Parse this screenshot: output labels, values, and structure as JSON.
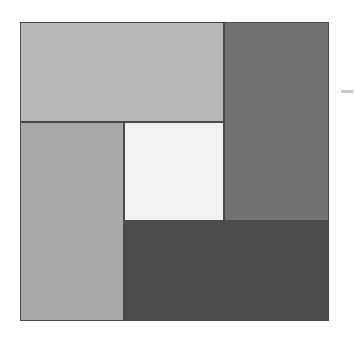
{
  "figure": {
    "background_color": "#ffffff",
    "width": 355,
    "height": 346,
    "border_color": "#4a4a4a"
  },
  "plot_area": {
    "x": 20,
    "y": 22,
    "width": 309,
    "height": 299
  },
  "axis_tick": {
    "name": "right-axis-tick",
    "x": 341,
    "y": 90,
    "width": 12,
    "height": 3,
    "color": "#c9c9c9"
  },
  "chart_data": {
    "type": "treemap",
    "title": "",
    "subtitle": "",
    "xlabel": "",
    "ylabel": "",
    "grid": false,
    "legend": "none",
    "layout": "pinwheel",
    "colormap": "greys",
    "total_area": 92391,
    "categories": [
      "A",
      "B",
      "C",
      "D",
      "E"
    ],
    "values": [
      20400,
      20895,
      20700,
      10100,
      20500
    ],
    "labels": [
      "",
      "",
      "",
      "",
      ""
    ],
    "rects": [
      {
        "id": "rect-top-left",
        "label": "",
        "value": 20400,
        "color": "#b8b8b8",
        "x": 20,
        "y": 22,
        "width": 204,
        "height": 100
      },
      {
        "id": "rect-right",
        "label": "",
        "value": 20895,
        "color": "#737373",
        "x": 224,
        "y": 22,
        "width": 105,
        "height": 199
      },
      {
        "id": "rect-left",
        "label": "",
        "value": 20700,
        "color": "#a8a8a8",
        "x": 20,
        "y": 122,
        "width": 104,
        "height": 199
      },
      {
        "id": "rect-center",
        "label": "",
        "value": 10100,
        "color": "#f2f2f2",
        "x": 124,
        "y": 122,
        "width": 100,
        "height": 99
      },
      {
        "id": "rect-bottom",
        "label": "",
        "value": 20500,
        "color": "#4d4d4d",
        "x": 124,
        "y": 221,
        "width": 205,
        "height": 100
      }
    ]
  }
}
